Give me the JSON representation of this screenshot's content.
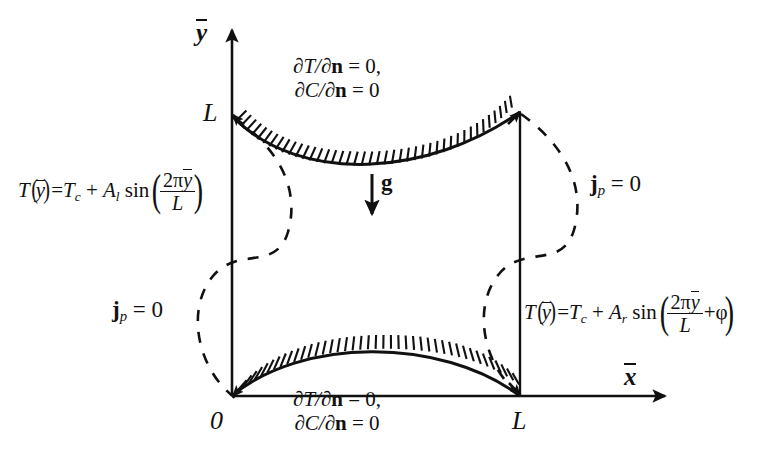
{
  "figure": {
    "type": "schematic-diagram",
    "background_color": "#ffffff",
    "line_color": "#111111"
  },
  "axes": {
    "y_axis_label": "y",
    "x_axis_label": "x",
    "y_axis_overline": true,
    "x_axis_overline": true
  },
  "ticks": {
    "origin": "0",
    "y_top": "L",
    "x_right": "L"
  },
  "boundaries": {
    "top": {
      "line1_lhs": "∂T/∂",
      "line1_vec": "n",
      "line1_rhs": " = 0,",
      "line2_lhs": "∂C/∂",
      "line2_vec": "n",
      "line2_rhs": " = 0"
    },
    "bottom": {
      "line1_lhs": "∂T/∂",
      "line1_vec": "n",
      "line1_rhs": " = 0,",
      "line2_lhs": "∂C/∂",
      "line2_vec": "n",
      "line2_rhs": " = 0"
    },
    "left_flux": {
      "vector": "j",
      "subscript": "p",
      "value": " = 0"
    },
    "right_flux": {
      "vector": "j",
      "subscript": "p",
      "value": " = 0"
    }
  },
  "gravity": {
    "symbol": "g",
    "direction": "downward"
  },
  "equations": {
    "left_wall": {
      "lhs_T": "T",
      "lhs_arg": "y",
      "eq": "=",
      "Tc": "T",
      "Tc_sub": "c",
      "plus": "+",
      "amp": "A",
      "amp_sub": "l",
      "fn": "sin",
      "num": "2π",
      "num_var": "y",
      "den": "L"
    },
    "right_wall": {
      "lhs_T": "T",
      "lhs_arg": "y",
      "eq": "=",
      "Tc": "T",
      "Tc_sub": "c",
      "plus": "+",
      "amp": "A",
      "amp_sub": "r",
      "fn": "sin",
      "num": "2π",
      "num_var": "y",
      "den": "L",
      "phase_plus": "+",
      "phase": "φ"
    }
  }
}
